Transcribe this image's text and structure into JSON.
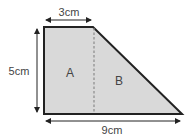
{
  "diagram": {
    "type": "composite-shape-area",
    "shape": "trapezoid split into rectangle and triangle",
    "colors": {
      "fill": "#d9d9d9",
      "outline": "#222222",
      "arrow": "#222222",
      "divider": "#8a8a8a",
      "text": "#444444"
    },
    "dimensions": {
      "top": "3cm",
      "left": "5cm",
      "bottom": "9cm"
    },
    "regions": [
      {
        "label": "A",
        "kind": "rectangle"
      },
      {
        "label": "B",
        "kind": "triangle"
      }
    ]
  }
}
